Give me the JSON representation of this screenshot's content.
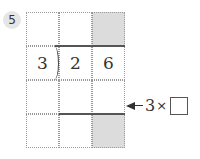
{
  "problem": {
    "number": "5",
    "divisor": "3",
    "dividend_digits": [
      "2",
      "6"
    ],
    "annotation": {
      "label": "3",
      "operator": "×",
      "blank": ""
    },
    "shaded_cells": [
      [
        0,
        2
      ],
      [
        3,
        2
      ]
    ],
    "colors": {
      "shade": "#dcdcdc",
      "grid": "#9a9a9a",
      "text": "#333333"
    }
  }
}
